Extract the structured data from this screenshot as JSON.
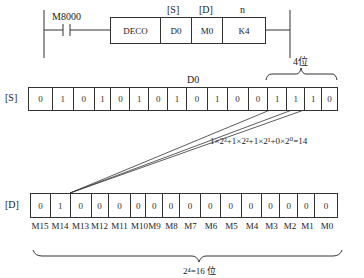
{
  "ladder": {
    "contact": "M8000",
    "instruction": "DECO",
    "operands": [
      {
        "header": "[S]",
        "value": "D0"
      },
      {
        "header": "[D]",
        "value": "M0"
      },
      {
        "header": "n",
        "value": "K4"
      }
    ]
  },
  "source": {
    "label": "[S]",
    "register": "D0",
    "bits": [
      "0",
      "1",
      "0",
      "1",
      "0",
      "1",
      "0",
      "1",
      "0",
      "1",
      "0",
      "0",
      "1",
      "1",
      "1",
      "0"
    ],
    "brace_label": "4位"
  },
  "formula": {
    "text": "1×2³+1×2²+1×2¹+0×2⁰=14"
  },
  "destination": {
    "label": "[D]",
    "bits": [
      "0",
      "1",
      "0",
      "0",
      "0",
      "0",
      "0",
      "0",
      "0",
      "0",
      "0",
      "0",
      "0",
      "0",
      "0",
      "0"
    ],
    "bit_names": [
      "M15",
      "M14",
      "M13",
      "M12",
      "M11",
      "M10",
      "M9",
      "M8",
      "M7",
      "M6",
      "M5",
      "M4",
      "M3",
      "M2",
      "M1",
      "M0"
    ],
    "brace_label": "2⁴=16 位"
  }
}
